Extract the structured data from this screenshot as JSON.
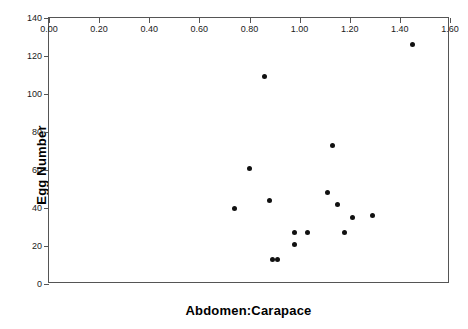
{
  "chart_data": {
    "type": "scatter",
    "title": "",
    "xlabel": "Abdomen:Carapace",
    "ylabel": "Egg Number",
    "xlim": [
      0.0,
      1.6
    ],
    "ylim": [
      0,
      140
    ],
    "grid": false,
    "legend": null,
    "marker": {
      "shape": "circle",
      "color": "#111111",
      "size_px": 5
    },
    "xticks": [
      "0.00",
      "0.20",
      "0.40",
      "0.60",
      "0.80",
      "1.00",
      "1.20",
      "1.40",
      "1.60"
    ],
    "xtick_values": [
      0.0,
      0.2,
      0.4,
      0.6,
      0.8,
      1.0,
      1.2,
      1.4,
      1.6
    ],
    "yticks": [
      "0",
      "20",
      "40",
      "60",
      "80",
      "100",
      "120",
      "140"
    ],
    "ytick_values": [
      0,
      20,
      40,
      60,
      80,
      100,
      120,
      140
    ],
    "x": [
      0.74,
      0.86,
      0.8,
      0.88,
      0.89,
      0.91,
      1.13,
      1.11,
      1.15,
      1.18,
      1.21,
      1.29,
      0.98,
      1.03,
      0.98,
      1.45
    ],
    "y": [
      40,
      109,
      61,
      44,
      13,
      13,
      73,
      48,
      42,
      27,
      35,
      36,
      27,
      27,
      21,
      126
    ],
    "points": [
      {
        "x": 0.74,
        "y": 40
      },
      {
        "x": 0.8,
        "y": 61
      },
      {
        "x": 0.86,
        "y": 109
      },
      {
        "x": 0.88,
        "y": 44
      },
      {
        "x": 0.89,
        "y": 13
      },
      {
        "x": 0.91,
        "y": 13
      },
      {
        "x": 0.98,
        "y": 27
      },
      {
        "x": 0.98,
        "y": 21
      },
      {
        "x": 1.03,
        "y": 27
      },
      {
        "x": 1.11,
        "y": 48
      },
      {
        "x": 1.13,
        "y": 73
      },
      {
        "x": 1.15,
        "y": 42
      },
      {
        "x": 1.18,
        "y": 27
      },
      {
        "x": 1.21,
        "y": 35
      },
      {
        "x": 1.29,
        "y": 36
      },
      {
        "x": 1.45,
        "y": 126
      }
    ],
    "n_points": 16
  },
  "axes": {
    "frame_color": "#555555"
  }
}
